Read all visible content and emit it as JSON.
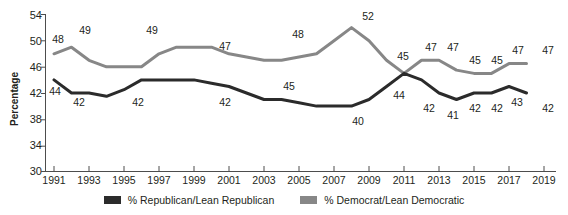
{
  "chart_data": {
    "type": "line",
    "title": "",
    "xlabel": "",
    "ylabel": "Percentage",
    "ylim": [
      30,
      54
    ],
    "yticks": [
      30,
      34,
      38,
      42,
      46,
      50,
      54
    ],
    "xlim": [
      1990.5,
      2019
    ],
    "xticks": [
      1991,
      1993,
      1995,
      1997,
      1999,
      2001,
      2003,
      2005,
      2007,
      2009,
      2011,
      2013,
      2015,
      2017,
      2019
    ],
    "grid": false,
    "legend_position": "bottom",
    "x": [
      1991,
      1992,
      1993,
      1994,
      1995,
      1996,
      1997,
      1998,
      1999,
      2000,
      2001,
      2002,
      2003,
      2004,
      2005,
      2006,
      2007,
      2008,
      2009,
      2010,
      2011,
      2012,
      2013,
      2014,
      2015,
      2016,
      2017,
      2018
    ],
    "series": [
      {
        "name": "% Republican/Lean Republican",
        "color": "#2b2b2b",
        "values": [
          44,
          42,
          42,
          41.5,
          42.5,
          44,
          44,
          44,
          44,
          43.5,
          43,
          42,
          41,
          41,
          40.5,
          40,
          40,
          40,
          41,
          43,
          45,
          44,
          42,
          41,
          42,
          42,
          43,
          42
        ]
      },
      {
        "name": "% Democrat/Lean Democratic",
        "color": "#878787",
        "values": [
          48,
          49,
          47,
          46,
          46,
          46,
          48,
          49,
          49,
          49,
          48,
          47.5,
          47,
          47,
          47.5,
          48,
          50,
          52,
          50,
          47,
          45,
          47,
          47,
          45.5,
          45,
          45,
          46.5,
          46.5
        ]
      }
    ],
    "annotations": [
      {
        "text": "48",
        "x": 1991,
        "series": "dem",
        "px": 45,
        "py": 33
      },
      {
        "text": "49",
        "x": 1993,
        "series": "dem",
        "px": 70,
        "py": 25
      },
      {
        "text": "49",
        "x": 1998,
        "series": "dem",
        "px": 138,
        "py": 25
      },
      {
        "text": "47",
        "x": 2003,
        "series": "dem",
        "px": 213,
        "py": 41
      },
      {
        "text": "48",
        "x": 2006,
        "series": "dem",
        "px": 286,
        "py": 30
      },
      {
        "text": "52",
        "x": 2008,
        "series": "dem",
        "px": 358,
        "py": 12
      },
      {
        "text": "45",
        "x": 2010,
        "series": "dem",
        "px": 393,
        "py": 51
      },
      {
        "text": "47",
        "x": 2012,
        "series": "dem",
        "px": 420,
        "py": 43
      },
      {
        "text": "47",
        "x": 2013,
        "series": "dem",
        "px": 440,
        "py": 43
      },
      {
        "text": "45",
        "x": 2015,
        "series": "dem",
        "px": 463,
        "py": 55
      },
      {
        "text": "45",
        "x": 2016,
        "series": "dem",
        "px": 484,
        "py": 55
      },
      {
        "text": "47",
        "x": 2017,
        "series": "dem",
        "px": 506,
        "py": 45
      },
      {
        "text": "47",
        "x": 2018,
        "series": "dem",
        "px": 535,
        "py": 45
      },
      {
        "text": "44",
        "x": 1991,
        "series": "rep",
        "px": 42,
        "py": 86
      },
      {
        "text": "42",
        "x": 1993,
        "series": "rep",
        "px": 65,
        "py": 97
      },
      {
        "text": "42",
        "x": 1996,
        "series": "rep",
        "px": 125,
        "py": 97
      },
      {
        "text": "42",
        "x": 2000,
        "series": "rep",
        "px": 213,
        "py": 97
      },
      {
        "text": "45",
        "x": 2004,
        "series": "rep",
        "px": 279,
        "py": 81
      },
      {
        "text": "40",
        "x": 2008,
        "series": "rep",
        "px": 348,
        "py": 117
      },
      {
        "text": "44",
        "x": 2010,
        "series": "rep",
        "px": 388,
        "py": 90
      },
      {
        "text": "42",
        "x": 2012,
        "series": "rep",
        "px": 418,
        "py": 103
      },
      {
        "text": "41",
        "x": 2013,
        "series": "rep",
        "px": 442,
        "py": 110
      },
      {
        "text": "42",
        "x": 2014,
        "series": "rep",
        "px": 464,
        "py": 103
      },
      {
        "text": "42",
        "x": 2015,
        "series": "rep",
        "px": 486,
        "py": 103
      },
      {
        "text": "43",
        "x": 2016,
        "series": "rep",
        "px": 506,
        "py": 97
      },
      {
        "text": "42",
        "x": 2018,
        "series": "rep",
        "px": 535,
        "py": 103
      }
    ]
  },
  "axis": {
    "ylabel": "Percentage",
    "yticks": [
      "54",
      "50",
      "46",
      "42",
      "38",
      "34",
      "30"
    ],
    "xticks": [
      "1991",
      "1993",
      "1995",
      "1997",
      "1999",
      "2001",
      "2003",
      "2005",
      "2007",
      "2009",
      "2011",
      "2013",
      "2015",
      "2017",
      "2019"
    ]
  },
  "legend": {
    "items": [
      {
        "label": "% Republican/Lean Republican",
        "color": "#2b2b2b"
      },
      {
        "label": "% Democrat/Lean Democratic",
        "color": "#878787"
      }
    ]
  }
}
